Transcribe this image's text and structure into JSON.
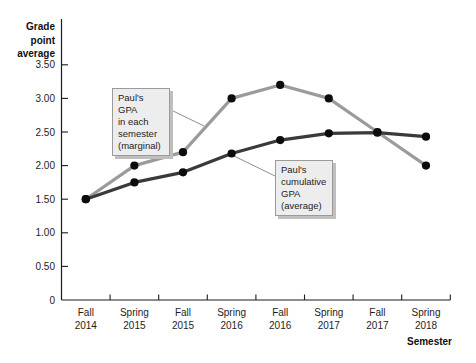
{
  "chart_data": {
    "type": "line",
    "title": "",
    "ylabel": "Grade\npoint\naverage",
    "xlabel": "Semester",
    "categories": [
      "Fall\n2014",
      "Spring\n2015",
      "Fall\n2015",
      "Spring\n2016",
      "Fall\n2016",
      "Spring\n2017",
      "Fall\n2017",
      "Spring\n2018"
    ],
    "y_ticks": [
      0,
      0.5,
      1.0,
      1.5,
      2.0,
      2.5,
      3.0,
      3.5
    ],
    "y_tick_labels": [
      "0",
      "0.50",
      "1.00",
      "1.50",
      "2.00",
      "2.50",
      "3.00",
      "3.50"
    ],
    "ylim": [
      0,
      3.7
    ],
    "grid": false,
    "legend_position": "annotation-callouts",
    "series": [
      {
        "name": "Paul's GPA in each semester (marginal)",
        "color": "#9b9b9b",
        "values": [
          1.5,
          2.0,
          2.2,
          3.0,
          3.2,
          3.0,
          2.5,
          2.0
        ]
      },
      {
        "name": "Paul's cumulative GPA (average)",
        "color": "#3a3a3a",
        "values": [
          1.5,
          1.75,
          1.9,
          2.18,
          2.38,
          2.48,
          2.49,
          2.43
        ]
      }
    ],
    "point_color": "#0c0c0c",
    "axis_color": "#1c1c1c",
    "tick_label_color": "#1d1d1d",
    "leader_color": "#8f8f8f",
    "annotations": [
      {
        "id": "marginal",
        "text": "Paul's GPA\nin each\nsemester\n(marginal)",
        "box": {
          "x": 112,
          "y": 88,
          "w": 58
        },
        "leader": {
          "x1": 169,
          "y1": 109,
          "x2": 204,
          "y2": 126
        }
      },
      {
        "id": "cumulative",
        "text": "Paul's\ncumulative\nGPA\n(average)",
        "box": {
          "x": 275,
          "y": 160,
          "w": 58
        },
        "leader": {
          "x1": 234,
          "y1": 156,
          "x2": 275,
          "y2": 176
        }
      }
    ],
    "geometry": {
      "left": 61.5,
      "right": 450.3,
      "bottom": 300,
      "top": 19,
      "px_per_unit": 67.2,
      "tick_len": 6.5,
      "point_radius": 4.1,
      "line_width": 3.2,
      "cat_label_y1": 315.5,
      "cat_label_y2": 328.5
    }
  }
}
